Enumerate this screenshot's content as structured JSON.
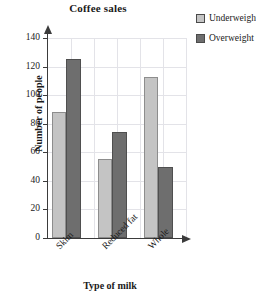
{
  "chart_data": {
    "type": "bar",
    "title": "Coffee sales",
    "xlabel": "Type of milk",
    "ylabel": "Number of people",
    "categories": [
      "Skim",
      "Reduced fat",
      "Whole"
    ],
    "series": [
      {
        "name": "Underweight",
        "color": "#c4c4c4",
        "values": [
          88,
          55,
          113
        ]
      },
      {
        "name": "Overweight",
        "color": "#6e6e6e",
        "values": [
          125,
          74,
          50
        ]
      }
    ],
    "ylim": [
      0,
      140
    ],
    "ytick_step": 20,
    "yticks": [
      0,
      20,
      40,
      60,
      80,
      100,
      120,
      140
    ],
    "ytick_labels": [
      "0",
      "20",
      "40",
      "60",
      "80",
      "100",
      "120",
      "140"
    ],
    "grid": true,
    "legend_position": "top-right",
    "axis_arrows": true,
    "category_label_rotation": -45
  },
  "legend": {
    "entries": [
      {
        "label": "Underweight",
        "swatch": "light"
      },
      {
        "label": "Overweight",
        "swatch": "dark"
      }
    ]
  }
}
